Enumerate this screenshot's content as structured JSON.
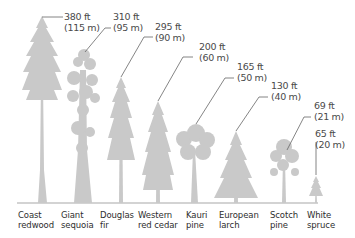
{
  "colors": {
    "tree": "#c9c9c9",
    "leader": "#666666",
    "ground": "#c4c4c4",
    "text": "#333333"
  },
  "trees": [
    {
      "name_line1": "Coast",
      "name_line2": "redwood",
      "height_ft": "380 ft",
      "height_m": "(115 m)"
    },
    {
      "name_line1": "Giant",
      "name_line2": "sequoia",
      "height_ft": "310 ft",
      "height_m": "(95 m)"
    },
    {
      "name_line1": "Douglas",
      "name_line2": "fir",
      "height_ft": "295 ft",
      "height_m": "(90 m)"
    },
    {
      "name_line1": "Western",
      "name_line2": "red cedar",
      "height_ft": "200 ft",
      "height_m": "(60 m)"
    },
    {
      "name_line1": "Kauri",
      "name_line2": "pine",
      "height_ft": "165 ft",
      "height_m": "(50 m)"
    },
    {
      "name_line1": "European",
      "name_line2": "larch",
      "height_ft": "130 ft",
      "height_m": "(40 m)"
    },
    {
      "name_line1": "Scotch",
      "name_line2": "pine",
      "height_ft": "69 ft",
      "height_m": "(21 m)"
    },
    {
      "name_line1": "White",
      "name_line2": "spruce",
      "height_ft": "65 ft",
      "height_m": "(20 m)"
    }
  ]
}
